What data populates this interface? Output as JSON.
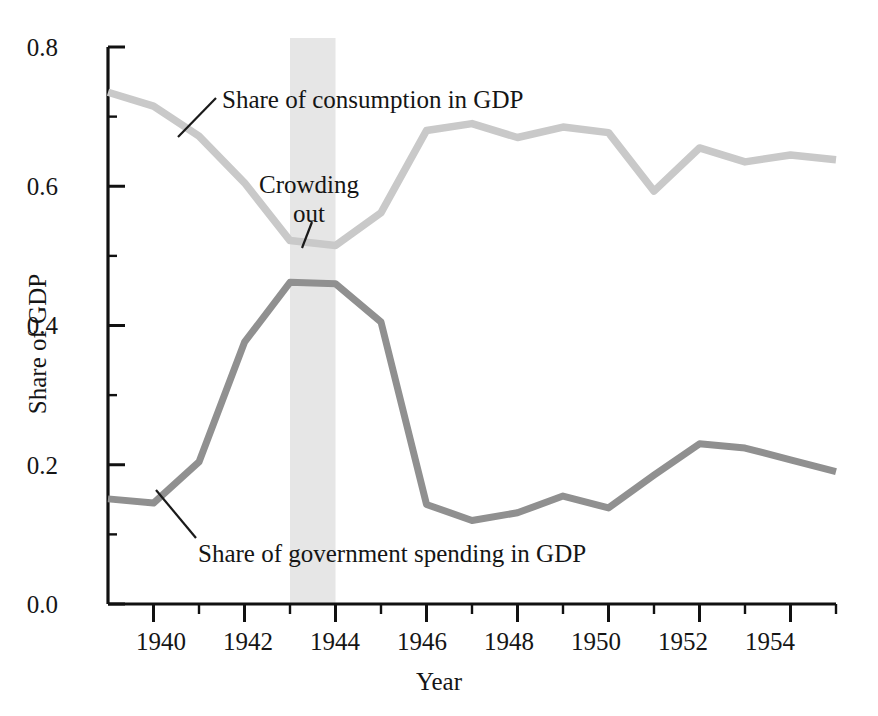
{
  "chart_data": {
    "type": "line",
    "title": "",
    "xlabel": "Year",
    "ylabel": "Share of GDP",
    "xlim": [
      1939,
      1955
    ],
    "ylim": [
      0.0,
      0.8
    ],
    "grid": false,
    "legend": "inline-annotations",
    "x": [
      1939,
      1940,
      1941,
      1942,
      1943,
      1944,
      1945,
      1946,
      1947,
      1948,
      1949,
      1950,
      1951,
      1952,
      1953,
      1954,
      1955
    ],
    "series": [
      {
        "name": "Share of consumption in GDP",
        "color": "#c9c9c9",
        "values": [
          0.735,
          0.715,
          0.672,
          0.605,
          0.522,
          0.515,
          0.562,
          0.68,
          0.69,
          0.67,
          0.685,
          0.677,
          0.593,
          0.655,
          0.635,
          0.645,
          0.638
        ]
      },
      {
        "name": "Share of government spending in GDP",
        "color": "#909090",
        "values": [
          0.151,
          0.145,
          0.204,
          0.376,
          0.462,
          0.46,
          0.405,
          0.143,
          0.12,
          0.131,
          0.155,
          0.138,
          0.185,
          0.23,
          0.224,
          0.207,
          0.19
        ]
      }
    ],
    "annotations": [
      {
        "id": "consumption",
        "text": "Share of consumption in GDP"
      },
      {
        "id": "government",
        "text": "Share of government spending in GDP"
      },
      {
        "id": "crowding",
        "text": "Crowding out",
        "line1": "Crowding",
        "line2": "out"
      }
    ],
    "shaded_region": {
      "label": "Crowding out",
      "x_start": 1943,
      "x_end": 1944,
      "color": "#e6e6e6"
    },
    "ytick_labels": [
      "0.8",
      "0.6",
      "0.4",
      "0.2",
      "0.0"
    ],
    "ytick_values": [
      0.8,
      0.6,
      0.4,
      0.2,
      0.0
    ],
    "yminor_values": [
      0.7,
      0.5,
      0.3,
      0.1
    ],
    "xtick_labels": [
      "1940",
      "1942",
      "1944",
      "1946",
      "1948",
      "1950",
      "1952",
      "1954"
    ],
    "xtick_values": [
      1940,
      1942,
      1944,
      1946,
      1948,
      1950,
      1952,
      1954
    ],
    "xminor_values": [
      1941,
      1943,
      1945,
      1947,
      1949,
      1951,
      1953,
      1955
    ]
  },
  "axis": {
    "y_title": "Share of GDP",
    "x_title": "Year"
  },
  "artifact": {
    "top_text": ""
  }
}
